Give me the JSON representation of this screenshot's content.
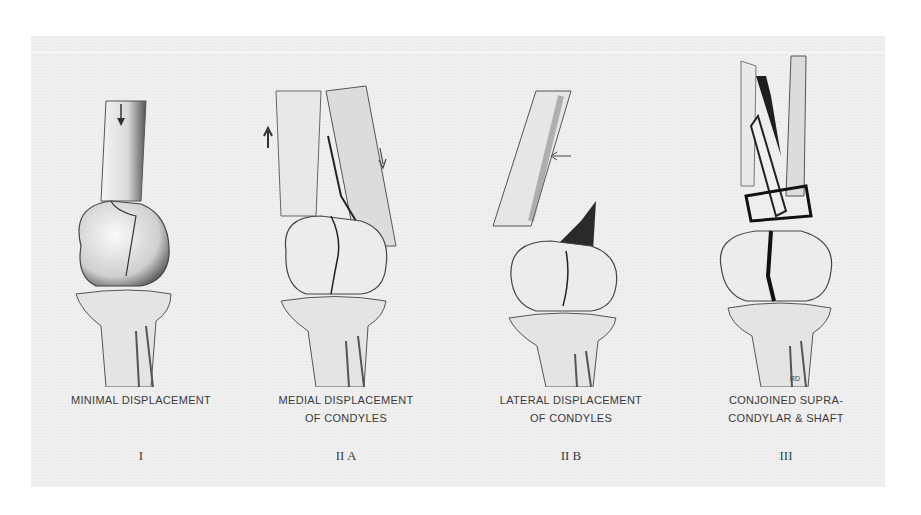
{
  "figure": {
    "panels": [
      {
        "caption_lines": [
          "Minimal displacement"
        ],
        "numeral": "I"
      },
      {
        "caption_lines": [
          "Medial displacement",
          "of condyles"
        ],
        "numeral": "II A"
      },
      {
        "caption_lines": [
          "Lateral displacement",
          "of condyles"
        ],
        "numeral": "II B"
      },
      {
        "caption_lines": [
          "Conjoined supra-",
          "condylar & shaft"
        ],
        "numeral": "III"
      }
    ],
    "signature": "RD"
  }
}
